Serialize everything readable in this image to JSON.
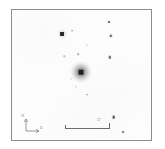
{
  "figure": {
    "kind": "astronomical-finder-chart",
    "background_color": "#fdfdfd",
    "frame_color": "#8d8d8d",
    "source_color": "#1d1d1d"
  },
  "frame": {
    "left": 11,
    "top": 9,
    "width": 141,
    "height": 132
  },
  "annotations": {
    "scalebar": {
      "label": "5″",
      "length_px": 44,
      "tick_color": "#6b6b6b",
      "label_color": "#808080"
    },
    "compass": {
      "north_label": "N",
      "east_label": "E",
      "color": "#8a8a8a"
    }
  },
  "chart_data": {
    "type": "scatter",
    "title": "",
    "xlabel": "",
    "ylabel": "",
    "grid": false,
    "legend": null,
    "xlim": [
      0,
      141
    ],
    "ylim": [
      0,
      132
    ],
    "note": "Positions in pixels relative to the image frame interior; size is the rendered marker diameter in px; shade 0-1 is darkness of the source.",
    "central_object": {
      "name": "host-galaxy",
      "x": 70,
      "y": 63,
      "halo_size": 26,
      "core_size": 5,
      "shade": 0.95
    },
    "point_sources": [
      {
        "id": "s1",
        "x": 51,
        "y": 24,
        "size": 4.0,
        "shade": 0.92
      },
      {
        "id": "s2",
        "x": 61,
        "y": 21,
        "size": 1.6,
        "shade": 0.32
      },
      {
        "id": "s3",
        "x": 98,
        "y": 12,
        "size": 2.0,
        "shade": 0.55
      },
      {
        "id": "s4",
        "x": 100,
        "y": 26,
        "size": 2.4,
        "shade": 0.62
      },
      {
        "id": "s5",
        "x": 99,
        "y": 48,
        "size": 2.4,
        "shade": 0.58
      },
      {
        "id": "s6",
        "x": 67,
        "y": 45,
        "size": 1.6,
        "shade": 0.28
      },
      {
        "id": "s7",
        "x": 53,
        "y": 47,
        "size": 1.4,
        "shade": 0.22
      },
      {
        "id": "s8",
        "x": 65,
        "y": 78,
        "size": 1.4,
        "shade": 0.22
      },
      {
        "id": "s9",
        "x": 76,
        "y": 86,
        "size": 1.8,
        "shade": 0.3
      },
      {
        "id": "s10",
        "x": 103,
        "y": 109,
        "size": 2.6,
        "shade": 0.7
      },
      {
        "id": "s11",
        "x": 113,
        "y": 124,
        "size": 2.0,
        "shade": 0.45
      },
      {
        "id": "s12",
        "x": 76,
        "y": 36,
        "size": 1.2,
        "shade": 0.18
      },
      {
        "id": "s13",
        "x": 60,
        "y": 70,
        "size": 1.3,
        "shade": 0.25
      }
    ]
  }
}
